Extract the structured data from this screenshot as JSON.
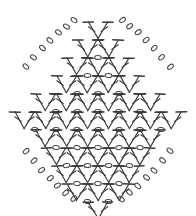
{
  "document": {
    "title": "Crochet Stitch Diagram",
    "kind": "pattern-chart",
    "shape": "diamond",
    "background_color": "#ffffff",
    "line_color": "#3a3a3a",
    "chain_color": "#4a4a4a"
  },
  "legend": {
    "symbols": [
      {
        "name": "double-crochet",
        "glyph": "T-with-slash",
        "description": "V-pair of double crochet stitches"
      },
      {
        "name": "chain-stitch",
        "glyph": "oval",
        "description": "chain stitch shown as small open oval"
      }
    ]
  },
  "chart_data": {
    "type": "diagram",
    "subtitle": "",
    "xlabel": "",
    "ylabel": "",
    "grid": false,
    "legend_position": "none",
    "motif": "diamond lattice of V-stitches",
    "geometry": {
      "center_x": 98,
      "center_y": 109,
      "half_width": 88,
      "half_height": 101,
      "row_count": 11,
      "max_units_per_row": 8,
      "unit_width": 21,
      "row_height": 18
    },
    "rows": [
      {
        "index": 1,
        "y": 22,
        "units": 1,
        "chains_left": 3,
        "chains_right": 3
      },
      {
        "index": 2,
        "y": 40,
        "units": 2,
        "chains_left": 3,
        "chains_right": 3
      },
      {
        "index": 3,
        "y": 58,
        "units": 3,
        "chains_left": 2,
        "chains_right": 2
      },
      {
        "index": 4,
        "y": 76,
        "units": 4,
        "chains_left": 2,
        "chains_right": 2
      },
      {
        "index": 5,
        "y": 94,
        "units": 6,
        "chains_left": 1,
        "chains_right": 1
      },
      {
        "index": 6,
        "y": 112,
        "units": 8,
        "chains_left": 1,
        "chains_right": 1
      },
      {
        "index": 7,
        "y": 130,
        "units": 6,
        "chains_left": 1,
        "chains_right": 1
      },
      {
        "index": 8,
        "y": 148,
        "units": 5,
        "chains_left": 2,
        "chains_right": 2
      },
      {
        "index": 9,
        "y": 166,
        "units": 4,
        "chains_left": 2,
        "chains_right": 2
      },
      {
        "index": 10,
        "y": 184,
        "units": 3,
        "chains_left": 3,
        "chains_right": 3
      },
      {
        "index": 11,
        "y": 202,
        "units": 1,
        "chains_left": 3,
        "chains_right": 3
      }
    ],
    "edge_chains": {
      "top_left": [
        [
          74,
          20
        ],
        [
          66,
          26
        ],
        [
          58,
          32
        ],
        [
          50,
          40
        ],
        [
          42,
          48
        ],
        [
          34,
          57
        ],
        [
          26,
          67
        ]
      ],
      "top_right": [
        [
          122,
          20
        ],
        [
          130,
          26
        ],
        [
          138,
          32
        ],
        [
          146,
          40
        ],
        [
          154,
          48
        ],
        [
          162,
          57
        ],
        [
          170,
          67
        ]
      ],
      "bottom_left": [
        [
          26,
          151
        ],
        [
          34,
          161
        ],
        [
          42,
          170
        ],
        [
          50,
          178
        ],
        [
          58,
          186
        ],
        [
          66,
          193
        ],
        [
          74,
          199
        ]
      ],
      "bottom_right": [
        [
          170,
          151
        ],
        [
          162,
          161
        ],
        [
          154,
          170
        ],
        [
          146,
          178
        ],
        [
          138,
          186
        ],
        [
          130,
          193
        ],
        [
          122,
          199
        ]
      ]
    }
  }
}
